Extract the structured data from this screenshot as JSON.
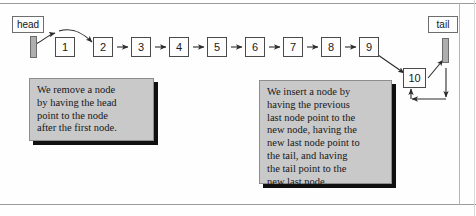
{
  "figure": {
    "type": "linked-list-diagram"
  },
  "pointers": {
    "head": {
      "label": "head"
    },
    "tail": {
      "label": "tail"
    }
  },
  "nodes": [
    {
      "value": "1"
    },
    {
      "value": "2"
    },
    {
      "value": "3"
    },
    {
      "value": "4"
    },
    {
      "value": "5"
    },
    {
      "value": "6"
    },
    {
      "value": "7"
    },
    {
      "value": "8"
    },
    {
      "value": "9"
    },
    {
      "value": "10"
    }
  ],
  "notes": {
    "left": {
      "lines": [
        "We remove a node",
        "by having the head",
        "point to the node",
        "after the first node."
      ]
    },
    "right": {
      "lines": [
        "We insert a node by",
        "having the previous",
        "last node point to the",
        "new  node, having the",
        "new last node point to",
        "the tail, and having",
        "the tail point to the",
        "new last node."
      ]
    }
  },
  "colors": {
    "node_border": "#4a4a4a",
    "node_fill": "#fdfdfd",
    "pointer_bar_fill": "#aeaeae",
    "note_fill": "#c9c9c9",
    "note_shadow": "#101010",
    "arrow": "#2b2b2b",
    "page_rule": "#9b9b9b"
  }
}
